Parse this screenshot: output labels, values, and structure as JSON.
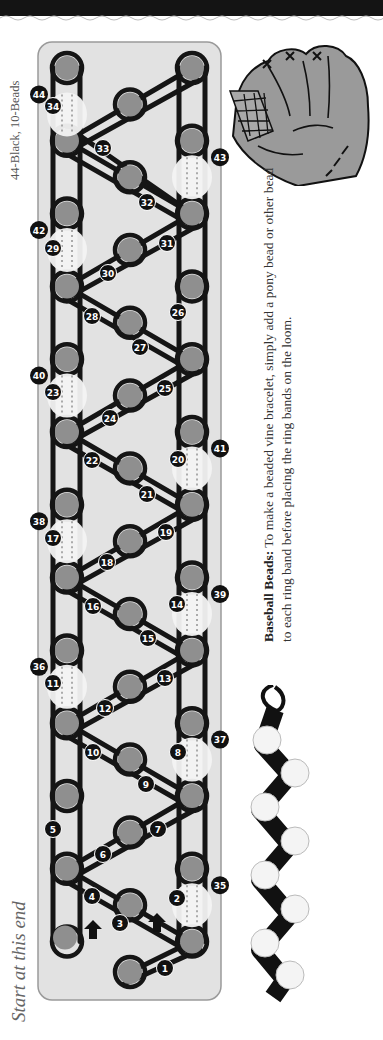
{
  "header": {
    "decoration": "wavy-top-border"
  },
  "labels": {
    "band_count": "44-Black, 10-Beads",
    "start_hint": "Start at this end"
  },
  "tip": {
    "title": "Baseball Beads:",
    "line1_rest": " To make a beaded vine bracelet, simply add a pony bead or other bead",
    "line2": "to each ring band before placing the ring bands on the loom."
  },
  "loom": {
    "colors": {
      "board": "#e2e2e2",
      "peg": "#8f8f8f",
      "band": "#151515",
      "bead": "#f3f3f3",
      "bead_seam": "#d0d0d0"
    },
    "band_labels": [
      "1",
      "2",
      "3",
      "4",
      "5",
      "6",
      "7",
      "8",
      "9",
      "10",
      "11",
      "12",
      "13",
      "14",
      "15",
      "16",
      "17",
      "18",
      "19",
      "20",
      "21",
      "22",
      "23",
      "24",
      "25",
      "26",
      "27",
      "28",
      "29",
      "30",
      "31",
      "32",
      "33",
      "34"
    ],
    "bead_labels": [
      "35",
      "36",
      "37",
      "38",
      "39",
      "40",
      "41",
      "42",
      "43",
      "44"
    ],
    "arrow_count": 2
  },
  "illustrations": {
    "glove": "baseball-glove",
    "bracelet": "baseball-bead-bracelet-photo"
  }
}
